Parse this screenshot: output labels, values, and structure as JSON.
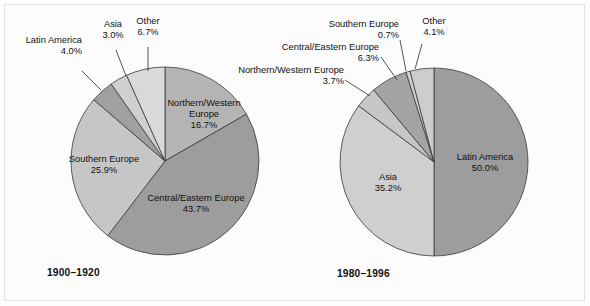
{
  "figure": {
    "background_color": "#fcfcfc",
    "frame_color": "#e3e3e3",
    "text_color": "#111111",
    "slice_outline_color": "#3a3a3a"
  },
  "chart_data": [
    {
      "type": "pie",
      "title": "1900–1920",
      "period_label": "1900–1920",
      "categories": [
        "Northern/Western Europe",
        "Central/Eastern Europe",
        "Southern Europe",
        "Latin America",
        "Asia",
        "Other"
      ],
      "values": [
        16.7,
        43.7,
        25.9,
        4.0,
        3.0,
        6.7
      ],
      "value_labels": [
        "16.7%",
        "43.7%",
        "25.9%",
        "4.0%",
        "3.0%",
        "6.7%"
      ],
      "colors": [
        "#b4b4b4",
        "#9d9d9d",
        "#c6c6c6",
        "#a0a0a0",
        "#cfcfcf",
        "#d9d9d9"
      ],
      "start_angle_deg": 0,
      "direction": "clockwise",
      "label_placement": [
        "inside",
        "inside",
        "inside",
        "outside",
        "outside",
        "outside"
      ],
      "center": {
        "x": 165,
        "y": 161
      },
      "radius": 94,
      "units": "percent"
    },
    {
      "type": "pie",
      "title": "1980–1996",
      "period_label": "1980–1996",
      "categories": [
        "Latin America",
        "Asia",
        "Northern/Western Europe",
        "Central/Eastern Europe",
        "Southern Europe",
        "Other"
      ],
      "values": [
        50.0,
        35.2,
        3.7,
        6.3,
        0.7,
        4.1
      ],
      "value_labels": [
        "50.0%",
        "35.2%",
        "3.7%",
        "6.3%",
        "0.7%",
        "4.1%"
      ],
      "colors": [
        "#9d9d9d",
        "#cfcfcf",
        "#c6c6c6",
        "#a4a4a4",
        "#d2d2d2",
        "#cdcdcd"
      ],
      "start_angle_deg": 0,
      "direction": "clockwise",
      "label_placement": [
        "inside",
        "inside",
        "outside",
        "outside",
        "outside",
        "outside"
      ],
      "center": {
        "x": 434,
        "y": 162
      },
      "radius": 94,
      "units": "percent"
    }
  ],
  "left_chart": {
    "period": "1900–1920",
    "inside_labels": [
      {
        "name": "Northern/Western Europe",
        "line1": "Northern/Western",
        "line2": "Europe",
        "pct": "16.7%"
      },
      {
        "name": "Central/Eastern Europe",
        "line1": "Central/Eastern Europe",
        "pct": "43.7%"
      },
      {
        "name": "Southern Europe",
        "line1": "Southern Europe",
        "pct": "25.9%"
      }
    ],
    "outside_labels": [
      {
        "name": "Latin America",
        "line1": "Latin America",
        "pct": "4.0%"
      },
      {
        "name": "Asia",
        "line1": "Asia",
        "pct": "3.0%"
      },
      {
        "name": "Other",
        "line1": "Other",
        "pct": "6.7%"
      }
    ]
  },
  "right_chart": {
    "period": "1980–1996",
    "inside_labels": [
      {
        "name": "Latin America",
        "line1": "Latin America",
        "pct": "50.0%"
      },
      {
        "name": "Asia",
        "line1": "Asia",
        "pct": "35.2%"
      }
    ],
    "outside_labels": [
      {
        "name": "Southern Europe",
        "line1": "Southern Europe",
        "pct": "0.7%"
      },
      {
        "name": "Other",
        "line1": "Other",
        "pct": "4.1%"
      },
      {
        "name": "Central/Eastern Europe",
        "line1": "Central/Eastern Europe",
        "pct": "6.3%"
      },
      {
        "name": "Northern/Western Europe",
        "line1": "Northern/Western Europe",
        "pct": "3.7%"
      }
    ]
  }
}
